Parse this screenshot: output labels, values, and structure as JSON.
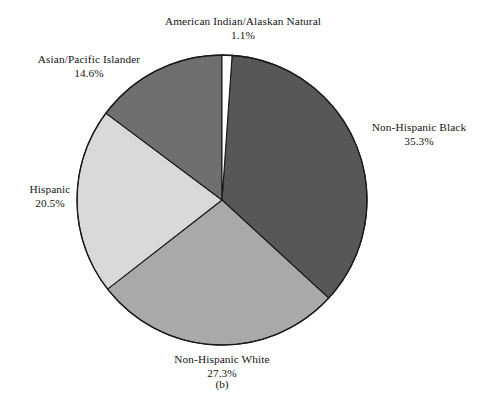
{
  "figure": {
    "caption": "(b)",
    "background_color": "#ffffff",
    "outline_color": "#1a1a1a"
  },
  "chart_data": {
    "type": "pie",
    "title": "",
    "subtitle": "",
    "xlabel": "",
    "ylabel": "",
    "legend_position": "none",
    "grid": false,
    "start_angle_deg": 0,
    "direction": "clockwise",
    "units": "percent",
    "total": 98.8,
    "categories": [
      "American Indian/Alaskan Natural",
      "Non-Hispanic Black",
      "Non-Hispanic White",
      "Hispanic",
      "Asian/Pacific Islander"
    ],
    "values": [
      1.1,
      35.3,
      27.3,
      20.5,
      14.6
    ],
    "slices": [
      {
        "label": "American Indian/Alaskan Natural",
        "percent_text": "1.1%",
        "value": 1.1,
        "color": "#ffffff",
        "start_angle_deg": 0.0,
        "end_angle_deg": 4.0
      },
      {
        "label": "Non-Hispanic Black",
        "percent_text": "35.3%",
        "value": 35.3,
        "color": "#575757",
        "start_angle_deg": 4.0,
        "end_angle_deg": 132.6
      },
      {
        "label": "Non-Hispanic White",
        "percent_text": "27.3%",
        "value": 27.3,
        "color": "#a9a9a9",
        "start_angle_deg": 132.6,
        "end_angle_deg": 232.1
      },
      {
        "label": "Hispanic",
        "percent_text": "20.5%",
        "value": 20.5,
        "color": "#d9d9d9",
        "start_angle_deg": 232.1,
        "end_angle_deg": 306.8
      },
      {
        "label": "Asian/Pacific Islander",
        "percent_text": "14.6%",
        "value": 14.6,
        "color": "#6f6f6f",
        "start_angle_deg": 306.8,
        "end_angle_deg": 360.0
      }
    ]
  }
}
